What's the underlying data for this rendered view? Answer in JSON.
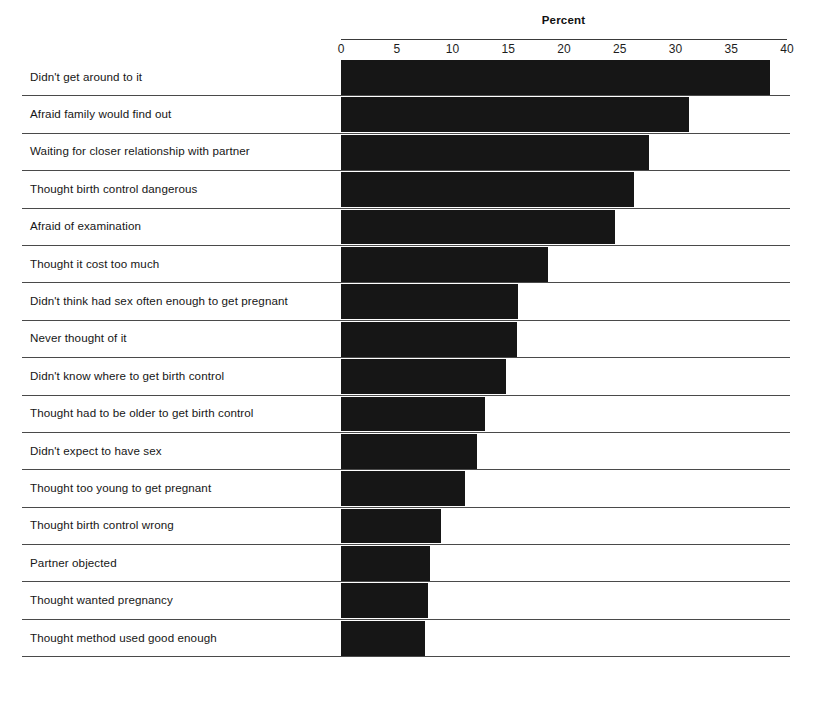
{
  "chart_data": {
    "type": "bar",
    "orientation": "horizontal",
    "title": "Percent",
    "xlabel": "Percent",
    "ylabel": "",
    "xlim": [
      0,
      40
    ],
    "xticks": [
      0,
      5,
      10,
      15,
      20,
      25,
      30,
      35,
      40
    ],
    "grid": false,
    "legend": null,
    "bar_color": "#161616",
    "categories": [
      "Didn't get around to it",
      "Afraid family would find out",
      "Waiting for closer relationship with partner",
      "Thought birth control dangerous",
      "Afraid of examination",
      "Thought it cost too much",
      "Didn't think had sex often enough to get pregnant",
      "Never thought of it",
      "Didn't know where to get birth control",
      "Thought had to be older to get birth control",
      "Didn't expect to have sex",
      "Thought too young to get pregnant",
      "Thought birth control wrong",
      "Partner objected",
      "Thought wanted pregnancy",
      "Thought method used good enough"
    ],
    "values": [
      38.5,
      31.2,
      27.6,
      26.3,
      24.6,
      18.6,
      15.9,
      15.8,
      14.8,
      12.9,
      12.2,
      11.1,
      9.0,
      8.0,
      7.8,
      7.5
    ]
  },
  "axis": {
    "title": "Percent",
    "ticks": [
      "0",
      "5",
      "10",
      "15",
      "20",
      "25",
      "30",
      "35",
      "40"
    ]
  },
  "rows": [
    {
      "label": "Didn't get around to it",
      "value": 38.5
    },
    {
      "label": "Afraid family would find out",
      "value": 31.2
    },
    {
      "label": "Waiting for closer relationship with partner",
      "value": 27.6
    },
    {
      "label": "Thought birth control dangerous",
      "value": 26.3
    },
    {
      "label": "Afraid of examination",
      "value": 24.6
    },
    {
      "label": "Thought it cost too much",
      "value": 18.6
    },
    {
      "label": "Didn't think had sex often enough to get pregnant",
      "value": 15.9
    },
    {
      "label": "Never thought of it",
      "value": 15.8
    },
    {
      "label": "Didn't know where to get birth control",
      "value": 14.8
    },
    {
      "label": "Thought had to be older to get birth control",
      "value": 12.9
    },
    {
      "label": "Didn't expect to have sex",
      "value": 12.2
    },
    {
      "label": "Thought too young to get pregnant",
      "value": 11.1
    },
    {
      "label": "Thought birth control wrong",
      "value": 9.0
    },
    {
      "label": "Partner objected",
      "value": 8.0
    },
    {
      "label": "Thought wanted pregnancy",
      "value": 7.8
    },
    {
      "label": "Thought method used good enough",
      "value": 7.5
    }
  ]
}
